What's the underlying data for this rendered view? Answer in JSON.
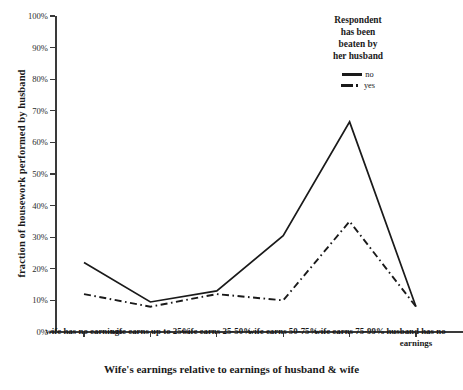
{
  "chart_data": {
    "type": "line",
    "title": "",
    "xlabel": "Wife's earnings relative to earnings of husband & wife",
    "ylabel": "fraction of housework performed by husband",
    "categories": [
      "wife has no earnings",
      "wife earns up to 25%",
      "wife earns 25-50%",
      "wife earns 50-75%",
      "wife earns 75-99%",
      "husband has no earnings"
    ],
    "series": [
      {
        "name": "no",
        "style": "solid",
        "values": [
          22,
          9.5,
          13,
          30.5,
          66.5,
          8
        ]
      },
      {
        "name": "yes",
        "style": "dash-dot",
        "values": [
          12,
          8,
          12,
          10,
          35,
          8
        ]
      }
    ],
    "ylim": [
      0,
      100
    ],
    "ytick_values": [
      0,
      10,
      20,
      30,
      40,
      50,
      60,
      70,
      80,
      90,
      100
    ],
    "ytick_labels": [
      "0%",
      "10%",
      "20%",
      "30%",
      "40%",
      "50%",
      "60%",
      "70%",
      "80%",
      "90%",
      "100%"
    ],
    "grid": false,
    "legend": {
      "position": "top-right",
      "title": "Respondent has been beaten by her husband",
      "title_lines": [
        "Respondent",
        "has been",
        "beaten by",
        "her husband"
      ],
      "entries": [
        {
          "label": "no",
          "style": "solid"
        },
        {
          "label": "yes",
          "style": "dash-dot"
        }
      ]
    },
    "colors": {
      "line": "#1a1a1a",
      "axis": "#3a3a3a",
      "background": "#ffffff"
    }
  }
}
